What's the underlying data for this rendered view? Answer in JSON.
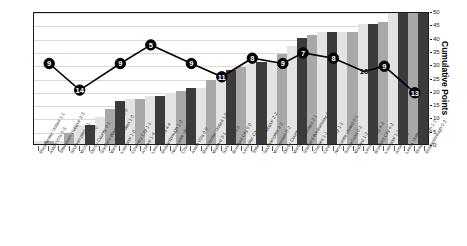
{
  "chart_data": {
    "type": "bar",
    "title": "",
    "xlabel": "",
    "ylabel": "Cumulative Points",
    "ylim": [
      0,
      50
    ],
    "yticks": [
      0,
      5,
      10,
      15,
      20,
      25,
      30,
      35,
      40,
      45,
      50
    ],
    "grid": true,
    "legend": "none",
    "categories": [
      "Manchester United 1-1",
      "Aston Villa 0-3",
      "Tottenham Hotspur 2-3",
      "Southampton 4-1",
      "Wimbledon 4-0",
      "Derby County 0-1",
      "Sheffield Wednesday 2-0",
      "West Ham United 1-0",
      "Liverpool 1-0",
      "Coventry City 1-1",
      "Arsenal 1-4",
      "Leeds United 4-4",
      "Middlesbrough 1-2",
      "Newcastle United 1-1",
      "Chelsea 1-1",
      "Aston Villa 0-0",
      "Manchester United 1-5",
      "Watford 3-1",
      "Sunderland 5-0",
      "Bradford City 0-0",
      "Leicester City 2-2",
      "Tottenham Hotspur 2-2",
      "Southampton 2-2",
      "Wimbledon 0-2",
      "Derby County 3-0",
      "West Ham United 2-1",
      "Sheffield Wednesday 4-0",
      "Chelsea 1-1",
      "Coventry City 1-1",
      "Newcastle United 0-1",
      "Sunderland 0-2",
      "Watford 1-2",
      "Leicester City 4-2",
      "Bradford City 4-2",
      "Liverpool 1-1",
      "Arsenal 4-0",
      "Leeds United 0-0",
      "Middlesbrough 1-1",
      "Middlesbrough 0-2"
    ],
    "values": [
      1,
      1,
      1,
      4,
      7,
      7,
      10,
      13,
      16,
      17,
      17,
      18,
      18,
      19,
      20,
      21,
      21,
      24,
      27,
      28,
      29,
      30,
      31,
      31,
      34,
      37,
      40,
      41,
      42,
      42,
      42,
      42,
      45,
      45,
      46,
      49,
      50,
      50,
      50
    ],
    "bar_shades": [
      "light",
      "mid",
      "light",
      "mid",
      "light",
      "dark",
      "light",
      "mid",
      "dark",
      "light",
      "mid",
      "light",
      "dark",
      "light",
      "mid",
      "dark",
      "light",
      "mid",
      "light",
      "dark",
      "mid",
      "light",
      "dark",
      "light",
      "mid",
      "light",
      "dark",
      "mid",
      "light",
      "dark",
      "light",
      "mid",
      "light",
      "dark",
      "mid",
      "light",
      "dark",
      "mid",
      "dark"
    ],
    "line_series": {
      "name": "League Position",
      "marker_labels": [
        9,
        14,
        9,
        5,
        9,
        11,
        8,
        9,
        7,
        8,
        10,
        9,
        13
      ],
      "marker_x_index": [
        1,
        4,
        8,
        11,
        15,
        18,
        21,
        24,
        26,
        29,
        32,
        34,
        37
      ],
      "marker_y_points": [
        31,
        21,
        31,
        38,
        31,
        26,
        33,
        31,
        35,
        33,
        28,
        30,
        20
      ]
    }
  },
  "axis": {
    "right_title": "Cumulative Points",
    "tick_labels": [
      "0",
      "5",
      "10",
      "15",
      "20",
      "25",
      "30",
      "35",
      "40",
      "45",
      "50"
    ]
  },
  "colors": {
    "bar_light": "#e3e3e3",
    "bar_mid": "#a8a8a8",
    "bar_dark": "#3b3b3b",
    "line": "#000000",
    "grid": "#d9d9d9",
    "frame": "#1a1a1a",
    "label_text": "#3a3a3a"
  }
}
